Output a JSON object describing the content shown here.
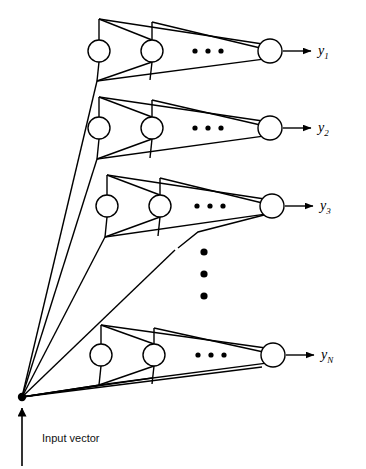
{
  "figure": {
    "type": "neural-network-diagram",
    "background_color": "#ffffff",
    "line_color": "#000000",
    "node_fill": "#ffffff",
    "node_stroke": "#000000"
  },
  "input": {
    "label": "Input vector",
    "node_name": "input-vector-node",
    "arrow_name": "input-vector-arrow",
    "dot": {
      "cx": 22,
      "cy": 397,
      "r": 4.2
    },
    "arrow": {
      "x": 22,
      "y_tail": 466,
      "y_head": 408
    },
    "label_pos": {
      "x": 42,
      "y": 432
    }
  },
  "rows": [
    {
      "id": "row-1",
      "output_label": "y",
      "output_sub": "1",
      "center_y": 51,
      "apex_y": 19,
      "base_y": 81,
      "neurons": [
        {
          "name": "neuron-r1-c1",
          "cx": 99,
          "cy": 51,
          "r": 11
        },
        {
          "name": "neuron-r1-c2",
          "cx": 152,
          "cy": 51,
          "r": 11
        },
        {
          "name": "neuron-r1-cN",
          "cx": 270,
          "cy": 51,
          "r": 12
        }
      ],
      "ellipsis_dots": [
        {
          "cx": 195,
          "cy": 51
        },
        {
          "cx": 208,
          "cy": 51
        },
        {
          "cx": 221,
          "cy": 51
        }
      ],
      "output_arrow": {
        "x1": 283,
        "x2": 311,
        "y": 51
      },
      "label_pos": {
        "x": 318,
        "y": 43
      }
    },
    {
      "id": "row-2",
      "output_label": "y",
      "output_sub": "2",
      "center_y": 128,
      "apex_y": 97,
      "base_y": 159,
      "neurons": [
        {
          "name": "neuron-r2-c1",
          "cx": 99,
          "cy": 128,
          "r": 11
        },
        {
          "name": "neuron-r2-c2",
          "cx": 152,
          "cy": 128,
          "r": 11
        },
        {
          "name": "neuron-r2-cN",
          "cx": 270,
          "cy": 128,
          "r": 12
        }
      ],
      "ellipsis_dots": [
        {
          "cx": 195,
          "cy": 128
        },
        {
          "cx": 208,
          "cy": 128
        },
        {
          "cx": 221,
          "cy": 128
        }
      ],
      "output_arrow": {
        "x1": 283,
        "x2": 311,
        "y": 128
      },
      "label_pos": {
        "x": 318,
        "y": 120
      }
    },
    {
      "id": "row-3",
      "output_label": "y",
      "output_sub": "3",
      "center_y": 206,
      "apex_y": 175,
      "base_y": 237,
      "neurons": [
        {
          "name": "neuron-r3-c1",
          "cx": 107,
          "cy": 206,
          "r": 11
        },
        {
          "name": "neuron-r3-c2",
          "cx": 160,
          "cy": 206,
          "r": 11
        },
        {
          "name": "neuron-r3-cN",
          "cx": 272,
          "cy": 206,
          "r": 12
        }
      ],
      "ellipsis_dots": [
        {
          "cx": 197,
          "cy": 206
        },
        {
          "cx": 210,
          "cy": 206
        },
        {
          "cx": 223,
          "cy": 206
        }
      ],
      "output_arrow": {
        "x1": 285,
        "x2": 313,
        "y": 206
      },
      "label_pos": {
        "x": 320,
        "y": 198
      }
    },
    {
      "id": "row-4",
      "output_label": "y",
      "output_sub": "N",
      "center_y": 355,
      "apex_y": 325,
      "base_y": 385,
      "neurons": [
        {
          "name": "neuron-rN-c1",
          "cx": 101,
          "cy": 355,
          "r": 11
        },
        {
          "name": "neuron-rN-c2",
          "cx": 154,
          "cy": 355,
          "r": 11
        },
        {
          "name": "neuron-rN-cN",
          "cx": 273,
          "cy": 355,
          "r": 12
        }
      ],
      "ellipsis_dots": [
        {
          "cx": 198,
          "cy": 355
        },
        {
          "cx": 211,
          "cy": 355
        },
        {
          "cx": 224,
          "cy": 355
        }
      ],
      "output_arrow": {
        "x1": 286,
        "x2": 314,
        "y": 355
      },
      "label_pos": {
        "x": 321,
        "y": 347
      }
    }
  ],
  "vertical_ellipsis": {
    "name": "vertical-ellipsis",
    "dots": [
      {
        "cx": 204,
        "cy": 252
      },
      {
        "cx": 204,
        "cy": 274
      },
      {
        "cx": 204,
        "cy": 296
      }
    ],
    "r": 3.6
  },
  "input_fan": {
    "name": "input-fan-lines",
    "targets": [
      {
        "to_row": "row-1",
        "x": 97,
        "y": 81
      },
      {
        "to_row": "row-2",
        "x": 97,
        "y": 159
      },
      {
        "to_row": "row-3",
        "x": 105,
        "y": 237
      },
      {
        "to_row": "row-3-bend",
        "x": 175,
        "y": 250,
        "bend_x": 198,
        "bend_y": 232
      },
      {
        "to_row": "row-4",
        "x": 100,
        "y": 385
      },
      {
        "to_row": "row-4-b",
        "x": 152,
        "y": 378
      }
    ]
  }
}
